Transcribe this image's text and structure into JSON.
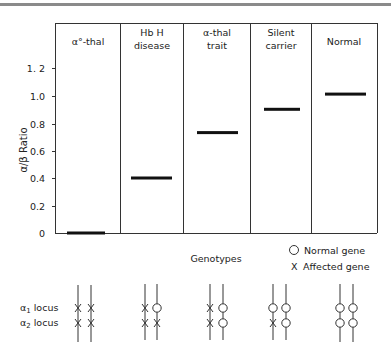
{
  "chart_data": {
    "type": "bar",
    "title": "",
    "xlabel": "Genotypes",
    "ylabel": "α/β Ratio",
    "ylim": [
      0,
      1.3
    ],
    "yticks": [
      "0",
      "0.2",
      "0.4",
      "0.6",
      "0.8",
      "1.0",
      "1. 2"
    ],
    "categories": [
      "α°-thal",
      "Hb H disease",
      "α-thal trait",
      "Silent carrier",
      "Normal"
    ],
    "values": [
      0.0,
      0.4,
      0.73,
      0.9,
      1.01
    ],
    "grid": false,
    "style": "horizontal level markers per category panel"
  },
  "panels": [
    {
      "line1": "α°-thal",
      "line2": ""
    },
    {
      "line1": "Hb H",
      "line2": "disease"
    },
    {
      "line1": "α-thal",
      "line2": "trait"
    },
    {
      "line1": "Silent",
      "line2": "carrier"
    },
    {
      "line1": "Normal",
      "line2": ""
    }
  ],
  "axis": {
    "ylabel": "α/β  Ratio",
    "ticks": [
      "1. 2",
      "1.0",
      "0.8",
      "0.6",
      "0.4",
      "0.2",
      "0"
    ],
    "xlabel": "Genotypes"
  },
  "legend": {
    "normal": "Normal gene",
    "affected": "Affected gene",
    "normal_symbol": "O",
    "affected_symbol": "X"
  },
  "loci": {
    "alpha1": "α",
    "alpha1_sub": "1",
    "alpha1_suffix": "locus",
    "alpha2": "α",
    "alpha2_sub": "2",
    "alpha2_suffix": "locus"
  },
  "genotypes": [
    {
      "a1": [
        "X",
        "X"
      ],
      "a2": [
        "X",
        "X"
      ]
    },
    {
      "a1": [
        "X",
        "O"
      ],
      "a2": [
        "X",
        "X"
      ]
    },
    {
      "a1": [
        "X",
        "O"
      ],
      "a2": [
        "X",
        "O"
      ]
    },
    {
      "a1": [
        "O",
        "O"
      ],
      "a2": [
        "X",
        "O"
      ]
    },
    {
      "a1": [
        "O",
        "O"
      ],
      "a2": [
        "O",
        "O"
      ]
    }
  ]
}
